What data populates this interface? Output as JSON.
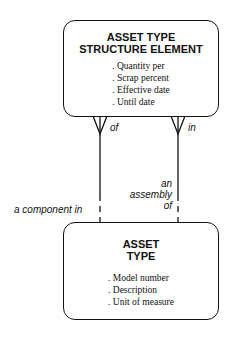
{
  "entities": {
    "top": {
      "title_line1": "ASSET TYPE",
      "title_line2": "STRUCTURE ELEMENT",
      "attributes": [
        ". Quantity per",
        ". Scrap percent",
        ". Effective date",
        ". Until date"
      ]
    },
    "bottom": {
      "title_line1": "ASSET",
      "title_line2": "TYPE",
      "attributes": [
        ". Model number",
        ". Description",
        ". Unit of measure"
      ]
    }
  },
  "relationships": {
    "left": {
      "top_label": "of",
      "bottom_label": "a component in"
    },
    "right": {
      "top_label": "in",
      "bottom_label_line1": "an",
      "bottom_label_line2": "assembly",
      "bottom_label_line3": "of"
    }
  }
}
